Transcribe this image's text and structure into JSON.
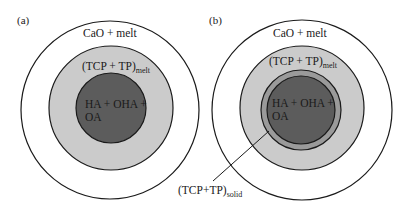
{
  "figure": {
    "panels": [
      {
        "label": "(a)",
        "outer_region": "CaO + melt",
        "middle_region": {
          "main": "(TCP + TP)",
          "sub": "melt"
        },
        "core_region": {
          "line1": "HA + OHA +",
          "line2": "OA"
        }
      },
      {
        "label": "(b)",
        "outer_region": "CaO + melt",
        "middle_region": {
          "main": "(TCP + TP)",
          "sub": "melt"
        },
        "core_region": {
          "line1": "HA + OHA +",
          "line2": "OA"
        },
        "ring_callout": {
          "main": "(TCP+TP)",
          "sub": "solid"
        }
      }
    ],
    "colors": {
      "outer_fill": "#ffffff",
      "middle_fill": "#cbcbcb",
      "ring_fill": "#9a9a9a",
      "core_fill": "#5c5c5c",
      "stroke": "#1a1a1a"
    }
  }
}
